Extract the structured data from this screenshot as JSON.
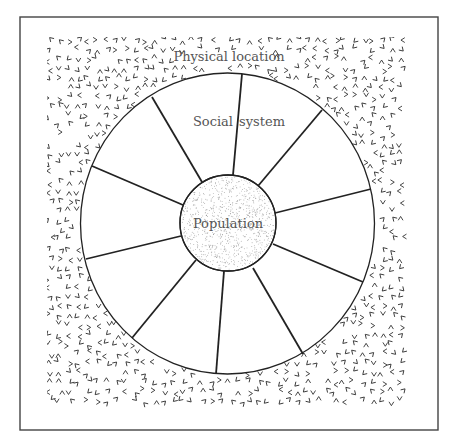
{
  "diagram": {
    "labels": {
      "outer": "Physical location",
      "ring_left": "Social",
      "ring_right": "system",
      "center": "Population"
    },
    "colors": {
      "line": "#222222",
      "frame": "#444444",
      "text": "#555555",
      "texture_mark": "#333333",
      "stipple": "#888888",
      "background": "#ffffff"
    },
    "frame": {
      "x": 20,
      "y": 17,
      "width": 418,
      "height": 413
    },
    "texture_region": {
      "x": 47,
      "y": 37,
      "width": 362,
      "height": 372
    },
    "outer_circle": {
      "cx": 227.5,
      "cy": 223.5,
      "rx": 147,
      "ry": 150.5
    },
    "inner_circle": {
      "cx": 228,
      "cy": 223,
      "r": 48
    },
    "spokes": [
      {
        "x1": 202,
        "y1": 182,
        "x2": 152,
        "y2": 97
      },
      {
        "x1": 233,
        "y1": 175,
        "x2": 242,
        "y2": 74
      },
      {
        "x1": 258,
        "y1": 186,
        "x2": 322,
        "y2": 110
      },
      {
        "x1": 275,
        "y1": 213,
        "x2": 371,
        "y2": 189
      },
      {
        "x1": 273,
        "y1": 244,
        "x2": 363,
        "y2": 282
      },
      {
        "x1": 253,
        "y1": 268,
        "x2": 303,
        "y2": 354
      },
      {
        "x1": 224,
        "y1": 271,
        "x2": 216,
        "y2": 374
      },
      {
        "x1": 196,
        "y1": 260,
        "x2": 132,
        "y2": 338
      },
      {
        "x1": 181,
        "y1": 236,
        "x2": 86,
        "y2": 259
      },
      {
        "x1": 183,
        "y1": 205,
        "x2": 92,
        "y2": 166
      }
    ],
    "label_positions": {
      "outer": {
        "x": 229,
        "y": 61,
        "size": 13
      },
      "ring_left": {
        "x": 213,
        "y": 126,
        "size": 13
      },
      "ring_right": {
        "x": 262,
        "y": 126,
        "size": 13
      },
      "center": {
        "x": 228,
        "y": 228,
        "size": 13
      }
    }
  }
}
